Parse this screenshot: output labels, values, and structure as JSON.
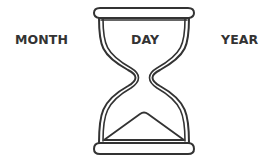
{
  "diagram": {
    "labels": {
      "left": "MONTH",
      "center": "DAY",
      "right": "YEAR"
    },
    "icon": "hourglass-icon",
    "colors": {
      "stroke": "#333333",
      "background": "#ffffff",
      "text": "#333333"
    }
  }
}
